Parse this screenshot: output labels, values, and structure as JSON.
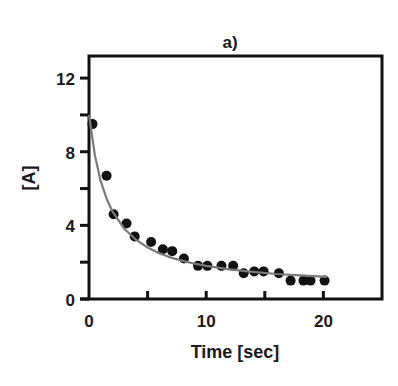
{
  "chart_data": {
    "type": "scatter",
    "title": "a)",
    "xlabel": "Time [sec]",
    "ylabel": "[A]",
    "xlim": [
      0,
      25
    ],
    "ylim": [
      0,
      13.2
    ],
    "xticks": [
      0,
      5,
      10,
      15,
      20,
      25
    ],
    "xtick_labels": [
      "0",
      "",
      "10",
      "",
      "20",
      ""
    ],
    "yticks": [
      0,
      2,
      4,
      6,
      8,
      10,
      12
    ],
    "ytick_labels": [
      "0",
      "",
      "4",
      "",
      "8",
      "",
      "12"
    ],
    "grid": false,
    "legend": null,
    "series": [
      {
        "name": "data",
        "type": "scatter",
        "color": "#111111",
        "x": [
          0.3,
          1.5,
          2.1,
          3.2,
          3.9,
          5.3,
          6.3,
          7.1,
          8.1,
          9.3,
          10.1,
          11.3,
          12.3,
          13.2,
          14.1,
          14.9,
          16.2,
          17.2,
          18.3,
          18.9,
          20.1
        ],
        "y": [
          9.5,
          6.7,
          4.6,
          4.1,
          3.4,
          3.1,
          2.7,
          2.6,
          2.2,
          1.8,
          1.8,
          1.8,
          1.8,
          1.4,
          1.5,
          1.5,
          1.4,
          1.0,
          1.0,
          1.0,
          1.0
        ]
      },
      {
        "name": "fit",
        "type": "line",
        "color": "#7a7a7a",
        "x": [
          0,
          0.5,
          1,
          1.5,
          2,
          3,
          4,
          5,
          6,
          7,
          8,
          9,
          10,
          12,
          14,
          16,
          18,
          20.3
        ],
        "y": [
          10.0,
          7.8,
          6.4,
          5.45,
          4.76,
          3.82,
          3.22,
          2.8,
          2.49,
          2.25,
          2.07,
          1.92,
          1.8,
          1.61,
          1.47,
          1.36,
          1.28,
          1.2
        ]
      }
    ]
  }
}
